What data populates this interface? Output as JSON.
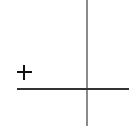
{
  "diagram": {
    "elements": [
      {
        "type": "vertical-line",
        "color": "#8a8a8a"
      },
      {
        "type": "horizontal-line",
        "color": "#333333"
      },
      {
        "type": "symbol",
        "icon": "plus-icon",
        "glyph": "+",
        "color": "#111111"
      }
    ]
  }
}
